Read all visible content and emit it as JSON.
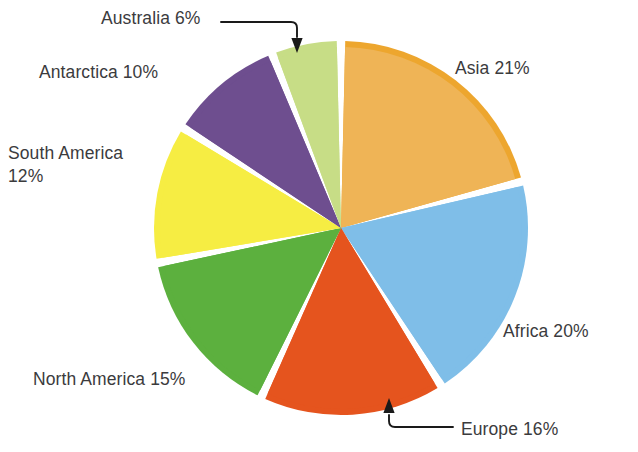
{
  "chart_data": {
    "type": "pie",
    "title": "",
    "subtitle": "",
    "xlabel": "",
    "ylabel": "",
    "legend_position": "none",
    "grid": false,
    "units": "percent",
    "total": 100,
    "start_angle_deg": 0,
    "direction": "clockwise",
    "categories": [
      "Asia",
      "Africa",
      "Europe",
      "North America",
      "South America",
      "Antarctica",
      "Australia"
    ],
    "values": [
      21,
      20,
      16,
      15,
      12,
      10,
      6
    ],
    "slices": [
      {
        "name": "Asia",
        "value": 21,
        "label": "Asia 21%",
        "color": "#EFB456",
        "rim_color": "#EDA62E",
        "start_deg": 0,
        "end_deg": 75.6,
        "has_leader": false
      },
      {
        "name": "Africa",
        "value": 20,
        "label": "Africa 20%",
        "color": "#7FBEE8",
        "rim_color": "#7FBEE8",
        "start_deg": 75.6,
        "end_deg": 147.6,
        "has_leader": false
      },
      {
        "name": "Europe",
        "value": 16,
        "label": "Europe 16%",
        "color": "#E5541E",
        "rim_color": "#E5541E",
        "start_deg": 147.6,
        "end_deg": 205.2,
        "has_leader": true
      },
      {
        "name": "North America",
        "value": 15,
        "label": "North America 15%",
        "color": "#5CB03E",
        "rim_color": "#5CB03E",
        "start_deg": 205.2,
        "end_deg": 259.2,
        "has_leader": false
      },
      {
        "name": "South America",
        "value": 12,
        "label": "South America\n12%",
        "color": "#F6ED43",
        "rim_color": "#F6ED43",
        "start_deg": 259.2,
        "end_deg": 302.4,
        "has_leader": false
      },
      {
        "name": "Antarctica",
        "value": 10,
        "label": "Antarctica 10%",
        "color": "#6E4E8F",
        "rim_color": "#6E4E8F",
        "start_deg": 302.4,
        "end_deg": 338.4,
        "has_leader": false
      },
      {
        "name": "Australia",
        "value": 6,
        "label": "Australia 6%",
        "color": "#C7DD86",
        "rim_color": "#C7DD86",
        "start_deg": 338.4,
        "end_deg": 360,
        "has_leader": true
      }
    ]
  },
  "labels": {
    "asia": "Asia 21%",
    "africa": "Africa 20%",
    "europe": "Europe 16%",
    "north_america": "North America 15%",
    "south_america": "South America\n12%",
    "antarctica": "Antarctica 10%",
    "australia": "Australia 6%"
  },
  "style": {
    "background": "#FFFFFF",
    "label_color": "#3B3B3D",
    "leader_color": "#1A1A1A",
    "slice_gap_color": "#FFFFFF"
  },
  "geometry": {
    "center_x": 341,
    "center_y": 228,
    "radius": 187
  }
}
